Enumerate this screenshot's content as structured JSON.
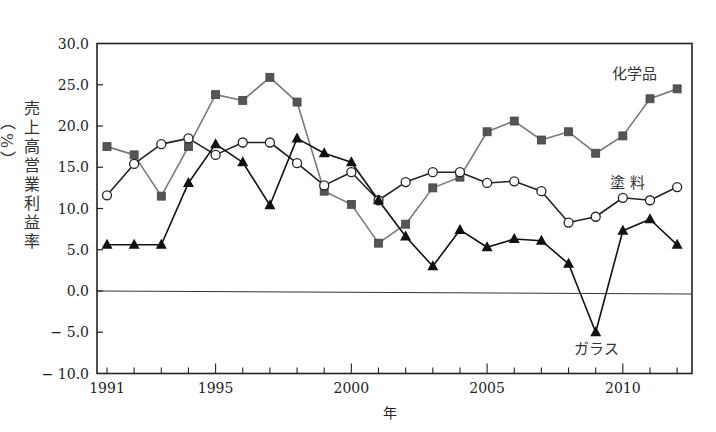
{
  "chart_data": {
    "type": "line",
    "title": "",
    "xlabel": "年",
    "ylabel": "売上高営業利益率（%）",
    "ylabel_main": "売上高営業利益率",
    "ylabel_unit": "（%）",
    "ylim": [
      -10.0,
      30.0
    ],
    "yticks": [
      "30.0",
      "25.0",
      "20.0",
      "15.0",
      "10.0",
      "5.0",
      "0.0",
      "-5.0",
      "-10.0"
    ],
    "ytick_values": [
      30,
      25,
      20,
      15,
      10,
      5,
      0,
      -5,
      -10
    ],
    "xlim": [
      1991,
      2012
    ],
    "xtick_labels": [
      "1991",
      "1995",
      "2000",
      "2005",
      "2010"
    ],
    "xtick_label_values": [
      1991,
      1995,
      2000,
      2005,
      2010
    ],
    "grid": false,
    "zero_line": true,
    "legend": "inline labels",
    "x": [
      1991,
      1992,
      1993,
      1994,
      1995,
      1996,
      1997,
      1998,
      1999,
      2000,
      2001,
      2002,
      2003,
      2004,
      2005,
      2006,
      2007,
      2008,
      2009,
      2010,
      2011,
      2012
    ],
    "series": [
      {
        "name": "化学品",
        "marker": "square",
        "line_color": "#7a7a7a",
        "marker_color": "#555555",
        "label_pos": [
          612,
          79
        ],
        "values": [
          17.5,
          16.5,
          11.5,
          17.5,
          23.8,
          23.1,
          25.9,
          22.9,
          12.1,
          10.5,
          5.8,
          8.1,
          12.5,
          13.8,
          19.3,
          20.6,
          18.3,
          19.3,
          16.7,
          18.8,
          23.3,
          24.5
        ]
      },
      {
        "name": "塗 料",
        "marker": "circle",
        "line_color": "#222222",
        "marker_color": "#ffffff",
        "label_pos": [
          610,
          188
        ],
        "values": [
          11.6,
          15.4,
          17.8,
          18.5,
          16.5,
          18.0,
          18.0,
          15.5,
          12.8,
          14.4,
          11.0,
          13.2,
          14.4,
          14.4,
          13.1,
          13.3,
          12.1,
          8.3,
          9.0,
          11.3,
          11.0,
          12.6
        ]
      },
      {
        "name": "ガラス",
        "marker": "triangle",
        "line_color": "#111111",
        "marker_color": "#111111",
        "label_pos": [
          574,
          354
        ],
        "values": [
          5.6,
          5.6,
          5.6,
          13.1,
          17.8,
          15.6,
          10.4,
          18.5,
          16.7,
          15.6,
          11.0,
          6.6,
          3.0,
          7.4,
          5.3,
          6.3,
          6.1,
          3.3,
          -5.0,
          7.3,
          8.7,
          5.6
        ]
      }
    ]
  }
}
